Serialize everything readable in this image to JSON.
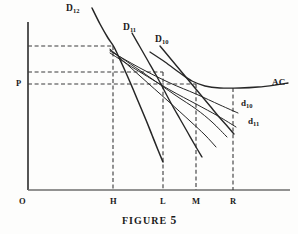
{
  "figure": {
    "caption_text": "FIGURE",
    "caption_number": "5",
    "background_color": "#fdfdfc",
    "ink_color": "#1a1a1a"
  },
  "chart_data": {
    "type": "line",
    "xlabel": "",
    "ylabel": "",
    "grid": false,
    "legend": "inline-labels",
    "axes": {
      "origin_label": "O",
      "x_axis_ticks": [
        "H",
        "L",
        "M",
        "R"
      ],
      "x_axis_tick_positions": [
        113,
        163,
        196,
        233
      ],
      "y_axis_ticks": [
        "P"
      ],
      "y_axis_tick_positions": [
        84
      ],
      "x_axis_y": 190,
      "y_axis_x": 28,
      "x_axis_end": 290,
      "y_axis_top": 22
    },
    "guide_lines": [
      {
        "name": "top-price-guide",
        "from_x": 28,
        "to_x": 113,
        "y": 46,
        "style": "dashed"
      },
      {
        "name": "mid-price-guide",
        "from_x": 28,
        "to_x": 163,
        "y": 72,
        "style": "dashed"
      },
      {
        "name": "p-price-guide",
        "from_x": 28,
        "to_x": 196,
        "y": 84,
        "style": "dashed"
      },
      {
        "name": "h-quantity-guide",
        "x": 113,
        "from_y": 46,
        "to_y": 190,
        "style": "dashed"
      },
      {
        "name": "l-quantity-guide",
        "x": 163,
        "from_y": 72,
        "to_y": 190,
        "style": "dashed"
      },
      {
        "name": "m-quantity-guide",
        "x": 196,
        "from_y": 84,
        "to_y": 190,
        "style": "dashed"
      },
      {
        "name": "r-quantity-guide",
        "x": 233,
        "from_y": 88,
        "to_y": 190,
        "style": "dashed"
      }
    ],
    "series": [
      {
        "name": "D12",
        "label": "D",
        "subscript": "12",
        "role": "market-demand-curve",
        "label_x": 70,
        "label_y": 7,
        "points": [
          [
            92,
            8
          ],
          [
            100,
            24
          ],
          [
            108,
            38
          ],
          [
            114,
            47
          ],
          [
            122,
            64
          ],
          [
            130,
            82
          ],
          [
            138,
            101
          ],
          [
            146,
            120
          ],
          [
            152,
            135
          ],
          [
            158,
            150
          ],
          [
            163,
            162
          ]
        ]
      },
      {
        "name": "D11",
        "label": "D",
        "subscript": "11",
        "role": "market-demand-curve",
        "label_x": 126,
        "label_y": 26,
        "points": [
          [
            132,
            33
          ],
          [
            140,
            47
          ],
          [
            148,
            61
          ],
          [
            156,
            75
          ],
          [
            164,
            90
          ],
          [
            172,
            105
          ],
          [
            180,
            119
          ],
          [
            188,
            133
          ],
          [
            196,
            147
          ],
          [
            202,
            157
          ]
        ]
      },
      {
        "name": "D10",
        "label": "D",
        "subscript": "10",
        "role": "market-demand-curve",
        "label_x": 158,
        "label_y": 38,
        "points": [
          [
            160,
            46
          ],
          [
            170,
            58
          ],
          [
            180,
            70
          ],
          [
            190,
            82
          ],
          [
            200,
            94
          ],
          [
            210,
            106
          ],
          [
            220,
            118
          ],
          [
            228,
            127
          ],
          [
            234,
            134
          ]
        ]
      },
      {
        "name": "d10",
        "label": "d",
        "subscript": "10",
        "role": "perceived-demand-curve",
        "label_x": 244,
        "label_y": 104,
        "points": [
          [
            110,
            51
          ],
          [
            140,
            68
          ],
          [
            170,
            83
          ],
          [
            196,
            94
          ],
          [
            220,
            105
          ],
          [
            238,
            113
          ]
        ]
      },
      {
        "name": "d11",
        "label": "d",
        "subscript": "11",
        "role": "perceived-demand-curve",
        "label_x": 248,
        "label_y": 121,
        "points": [
          [
            110,
            53
          ],
          [
            140,
            72
          ],
          [
            170,
            90
          ],
          [
            196,
            104
          ],
          [
            218,
            116
          ],
          [
            236,
            127
          ]
        ]
      },
      {
        "name": "d-extra-1",
        "label": "",
        "subscript": "",
        "role": "perceived-demand-curve",
        "label_x": 0,
        "label_y": 0,
        "points": [
          [
            110,
            50
          ],
          [
            145,
            74
          ],
          [
            175,
            95
          ],
          [
            196,
            109
          ],
          [
            212,
            122
          ],
          [
            227,
            137
          ]
        ]
      },
      {
        "name": "d-extra-2",
        "label": "",
        "subscript": "",
        "role": "perceived-demand-curve",
        "label_x": 0,
        "label_y": 0,
        "points": [
          [
            110,
            49
          ],
          [
            140,
            76
          ],
          [
            168,
            101
          ],
          [
            190,
            121
          ],
          [
            205,
            135
          ],
          [
            216,
            147
          ]
        ]
      },
      {
        "name": "AC",
        "label": "AC",
        "subscript": "",
        "role": "average-cost-curve",
        "label_x": 272,
        "label_y": 83,
        "points": [
          [
            150,
            52
          ],
          [
            165,
            62
          ],
          [
            180,
            73
          ],
          [
            192,
            81
          ],
          [
            205,
            86
          ],
          [
            220,
            88
          ],
          [
            240,
            88
          ],
          [
            258,
            87
          ],
          [
            275,
            85
          ],
          [
            288,
            83
          ]
        ]
      }
    ]
  },
  "labels": {
    "origin": "O",
    "price_level": "P",
    "tick_h": "H",
    "tick_l": "L",
    "tick_m": "M",
    "tick_r": "R",
    "ac": "AC",
    "d12_base": "D",
    "d12_sub": "12",
    "d11_base": "D",
    "d11_sub": "11",
    "d10_base": "D",
    "d10_sub": "10",
    "small_d10_base": "d",
    "small_d10_sub": "10",
    "small_d11_base": "d",
    "small_d11_sub": "11"
  }
}
